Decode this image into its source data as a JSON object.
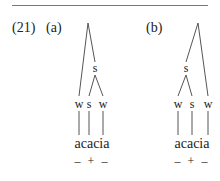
{
  "example": {
    "number": "(21)",
    "panels": [
      {
        "label": "(a)",
        "intermediate_node": "s",
        "leaves": [
          "w",
          "s",
          "w"
        ],
        "word": "acacia",
        "stress_marks": "– + –"
      },
      {
        "label": "(b)",
        "intermediate_node": "s",
        "leaves": [
          "w",
          "s",
          "w"
        ],
        "word": "acacia",
        "stress_marks": "– + –"
      }
    ]
  }
}
